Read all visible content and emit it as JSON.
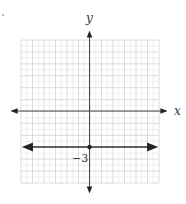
{
  "diagram": {
    "type": "coordinate-plane",
    "axes": {
      "x_label": "x",
      "y_label": "y"
    },
    "grid": {
      "x_min": -6,
      "x_max": 6,
      "y_min": -6,
      "y_max": 6,
      "step": 1,
      "grid_color": "#d8d8d8",
      "axis_color": "#444444"
    },
    "lines": [
      {
        "name": "horizontal line",
        "equation": "y = -3",
        "y": -3,
        "color": "#333333",
        "arrows": "both"
      }
    ],
    "points": [
      {
        "x": 0,
        "y": -3,
        "label": "−3"
      }
    ],
    "annotations": [
      {
        "text": "−3",
        "near": "y-intercept"
      }
    ]
  }
}
